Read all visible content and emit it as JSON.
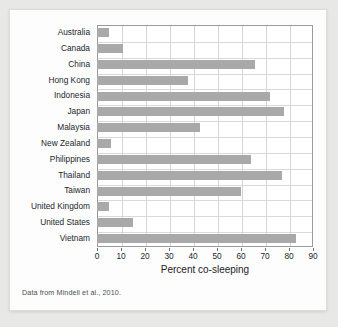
{
  "figure": {
    "caption": "Data from Mindell et al., 2010.",
    "bar_color": "#a9a9a9",
    "grid_color": "#d5d5d5",
    "frame_color": "#9a9a9a",
    "background": "#ffffff"
  },
  "chart_data": {
    "type": "bar",
    "orientation": "horizontal",
    "title": "",
    "xlabel": "Percent co-sleeping",
    "ylabel": "",
    "xlim": [
      0,
      90
    ],
    "ylim": null,
    "xticks": [
      0,
      10,
      20,
      30,
      40,
      50,
      60,
      70,
      80,
      90
    ],
    "xtick_labels": [
      "0",
      "10",
      "20",
      "30",
      "40",
      "50",
      "60",
      "70",
      "80",
      "90"
    ],
    "grid": true,
    "legend": null,
    "categories": [
      "Australia",
      "Canada",
      "China",
      "Hong Kong",
      "Indonesia",
      "Japan",
      "Malaysia",
      "New Zealand",
      "Philippines",
      "Thailand",
      "Taiwan",
      "United Kingdom",
      "United States",
      "Vietnam"
    ],
    "values": [
      5,
      11,
      66,
      38,
      72,
      78,
      43,
      6,
      64,
      77,
      60,
      5,
      15,
      83
    ],
    "units": "percent"
  }
}
